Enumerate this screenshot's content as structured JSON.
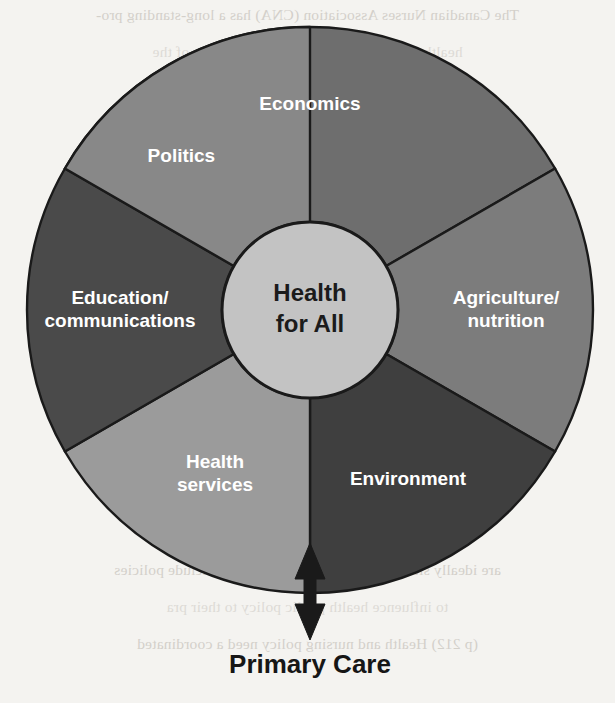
{
  "figure": {
    "center": {
      "line1": "Health",
      "line2": "for All"
    },
    "caption": "Primary Care",
    "arrow": {
      "name": "double-headed-arrow",
      "direction": "up-down"
    }
  },
  "chart_data": {
    "type": "pie",
    "title": "Health for All",
    "subtitle": "Primary Care",
    "center_label": "Health for All",
    "categories": [
      "Economics",
      "Agriculture/ nutrition",
      "Environment",
      "Health services",
      "Education/ communications",
      "Politics"
    ],
    "values": [
      60,
      60,
      60,
      60,
      60,
      60
    ],
    "units": "degrees",
    "colors": [
      "#6e6e6e",
      "#7c7c7c",
      "#3f3f3f",
      "#9b9b9b",
      "#4a4a4a",
      "#888888"
    ],
    "label_colors": [
      "#ffffff",
      "#ffffff",
      "#ffffff",
      "#ffffff",
      "#ffffff",
      "#ffffff"
    ],
    "hub_color": "#c3c3c3",
    "stroke_color": "#1a1a1a",
    "legend": "none",
    "grid": false,
    "xlabel": "",
    "ylabel": ""
  },
  "segments": [
    {
      "id": "economics",
      "label": "Economics",
      "lines": [
        "Economics"
      ],
      "color": "#6e6e6e",
      "start_deg": -60,
      "end_deg": 60,
      "label_radius": 205,
      "label_deg": 0
    },
    {
      "id": "agriculture-nutrition",
      "label": "Agriculture/ nutrition",
      "lines": [
        "Agriculture/",
        "nutrition"
      ],
      "color": "#7c7c7c",
      "start_deg": 60,
      "end_deg": 120,
      "label_radius": 196,
      "label_deg": 90
    },
    {
      "id": "environment",
      "label": "Environment",
      "lines": [
        "Environment"
      ],
      "color": "#3f3f3f",
      "start_deg": 120,
      "end_deg": 180,
      "label_radius": 196,
      "label_deg": 150
    },
    {
      "id": "health-services",
      "label": "Health services",
      "lines": [
        "Health",
        "services"
      ],
      "color": "#9b9b9b",
      "start_deg": 180,
      "end_deg": 240,
      "label_radius": 190,
      "label_deg": 210
    },
    {
      "id": "education-communications",
      "label": "Education/ communications",
      "lines": [
        "Education/",
        "communications"
      ],
      "color": "#4a4a4a",
      "start_deg": 240,
      "end_deg": 300,
      "label_radius": 190,
      "label_deg": 270
    },
    {
      "id": "politics",
      "label": "Politics",
      "lines": [
        "Politics"
      ],
      "color": "#888888",
      "start_deg": 300,
      "end_deg": 360,
      "label_radius": 200,
      "label_deg": 320
    }
  ],
  "background_text": {
    "note": "faint mirrored bleed-through from reverse of scanned page",
    "lines": [
      "The Canadian Nurses Association (CNA) has a long-standing pro-",
      "health care system based on the principles of the",
      "note Health for All in the 21st century, nursing a",
      "nurses are strategically positioned to edu, 2003",
      "",
      "promoting health and well-being is a well-",
      "public health nursing practice. Throughout hi",
      "have influenced the social and political environ",
      "to improve the health of populations. Today",
      "a renewed emphasis on health promotion and",
      "public health, and community health nursing",
      "a broader framework that addresses the bro",
      "ces can be found in every setting and their",
      "de to respond with care and that involves and reflects",
      "priorities of and advocates of stated that nurses",
      "are ideally situated and morally obligated to include policies",
      "to influence health public policy to their pra",
      "(p 212) Health and nursing policy need a coordinated"
    ]
  }
}
